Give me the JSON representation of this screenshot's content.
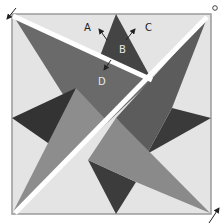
{
  "diagram": {
    "type": "geometric-pinwheel-star",
    "labels": [
      {
        "id": "A",
        "text": "A",
        "x": 84,
        "y": 31
      },
      {
        "id": "B",
        "text": "B",
        "x": 121,
        "y": 54
      },
      {
        "id": "C",
        "text": "C",
        "x": 147,
        "y": 31
      },
      {
        "id": "D",
        "text": "D",
        "x": 100,
        "y": 84
      }
    ],
    "colors": {
      "background": "#e4e4e4",
      "border": "#9a9a9a",
      "dark": "#3f3f3f",
      "mid_dark": "#5e5e5e",
      "mid": "#7c7c7c",
      "light_mid": "#9a9a9a",
      "cut_line": "#ffffff",
      "arrow": "#222222"
    }
  }
}
